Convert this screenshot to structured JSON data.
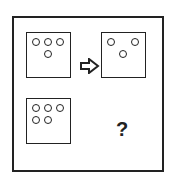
{
  "puzzle": {
    "panels": [
      {
        "id": "top-left",
        "dots": [
          [
            5,
            5
          ],
          [
            17,
            5
          ],
          [
            29,
            5
          ],
          [
            17,
            17
          ]
        ]
      },
      {
        "id": "top-right",
        "dots": [
          [
            5,
            5
          ],
          [
            29,
            5
          ],
          [
            17,
            17
          ]
        ]
      },
      {
        "id": "bottom-left",
        "dots": [
          [
            5,
            5
          ],
          [
            17,
            5
          ],
          [
            29,
            5
          ],
          [
            5,
            17
          ],
          [
            17,
            17
          ]
        ]
      }
    ],
    "arrow": "right-arrow-outline",
    "unknown_label": "?"
  },
  "colors": {
    "stroke": "#222222",
    "background": "#ffffff"
  }
}
